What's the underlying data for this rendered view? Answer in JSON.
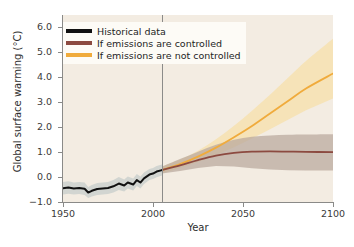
{
  "chart_data": {
    "type": "line",
    "title": "",
    "xlabel": "Year",
    "ylabel": "Global surface warming (°C)",
    "xlim": [
      1950,
      2100
    ],
    "ylim": [
      -1.0,
      6.5
    ],
    "xticks": [
      1950,
      2000,
      2050,
      2100
    ],
    "yticks": [
      -1.0,
      0.0,
      1.0,
      2.0,
      3.0,
      4.0,
      5.0,
      6.0
    ],
    "ytick_labels": [
      "−1.0",
      "0.0",
      "1.0",
      "2.0",
      "3.0",
      "4.0",
      "5.0",
      "6.0"
    ],
    "xtick_labels": [
      "1950",
      "2000",
      "2050",
      "2100"
    ],
    "grid": false,
    "legend_position": "top-left",
    "divider_year": 2005,
    "colors": {
      "historical": "#111111",
      "controlled": "#8c4a40",
      "uncontrolled": "#f0ab3c",
      "historical_band": "#b6c2c2",
      "controlled_band": "#b9a79d",
      "uncontrolled_band": "#f7dfa8",
      "plot_background": "#f3ece2",
      "axis": "#8a8a88"
    },
    "series": [
      {
        "name": "Historical data",
        "color": "#111111",
        "x": [
          1950,
          1953,
          1956,
          1959,
          1962,
          1964,
          1966,
          1969,
          1972,
          1975,
          1978,
          1981,
          1984,
          1986,
          1989,
          1991,
          1993,
          1995,
          1998,
          2000,
          2002,
          2005
        ],
        "values": [
          -0.45,
          -0.42,
          -0.46,
          -0.44,
          -0.47,
          -0.62,
          -0.55,
          -0.48,
          -0.46,
          -0.44,
          -0.37,
          -0.26,
          -0.34,
          -0.22,
          -0.3,
          -0.12,
          -0.22,
          -0.05,
          0.1,
          0.14,
          0.22,
          0.28
        ],
        "band_low": [
          -0.7,
          -0.67,
          -0.7,
          -0.68,
          -0.72,
          -0.84,
          -0.78,
          -0.72,
          -0.7,
          -0.68,
          -0.62,
          -0.52,
          -0.58,
          -0.46,
          -0.54,
          -0.36,
          -0.46,
          -0.28,
          -0.12,
          -0.08,
          -0.01,
          0.06
        ],
        "band_high": [
          -0.2,
          -0.17,
          -0.22,
          -0.2,
          -0.22,
          -0.4,
          -0.32,
          -0.24,
          -0.22,
          -0.2,
          -0.12,
          0.0,
          -0.1,
          0.02,
          -0.06,
          0.12,
          0.02,
          0.18,
          0.32,
          0.36,
          0.44,
          0.5
        ]
      },
      {
        "name": "If emissions are controlled",
        "color": "#8c4a40",
        "x": [
          2005,
          2015,
          2025,
          2035,
          2045,
          2055,
          2065,
          2075,
          2085,
          2100
        ],
        "values": [
          0.28,
          0.47,
          0.68,
          0.86,
          0.97,
          1.02,
          1.03,
          1.02,
          1.01,
          1.0
        ],
        "band_low": [
          0.14,
          0.24,
          0.36,
          0.44,
          0.42,
          0.35,
          0.3,
          0.27,
          0.26,
          0.26
        ],
        "band_high": [
          0.42,
          0.72,
          1.02,
          1.3,
          1.5,
          1.62,
          1.67,
          1.7,
          1.71,
          1.72
        ]
      },
      {
        "name": "If emissions are not controlled",
        "color": "#f0ab3c",
        "x": [
          2005,
          2015,
          2025,
          2035,
          2045,
          2055,
          2065,
          2075,
          2085,
          2100
        ],
        "values": [
          0.28,
          0.52,
          0.82,
          1.18,
          1.6,
          2.05,
          2.55,
          3.05,
          3.55,
          4.15
        ],
        "band_low": [
          0.14,
          0.36,
          0.6,
          0.88,
          1.2,
          1.55,
          1.92,
          2.3,
          2.68,
          3.15
        ],
        "band_high": [
          0.42,
          0.7,
          1.06,
          1.52,
          2.06,
          2.66,
          3.3,
          3.98,
          4.66,
          5.55
        ]
      }
    ],
    "legend": [
      {
        "label": "Historical data",
        "color": "#111111"
      },
      {
        "label": "If emissions are controlled",
        "color": "#8c4a40"
      },
      {
        "label": "If emissions are not controlled",
        "color": "#f0ab3c"
      }
    ]
  }
}
